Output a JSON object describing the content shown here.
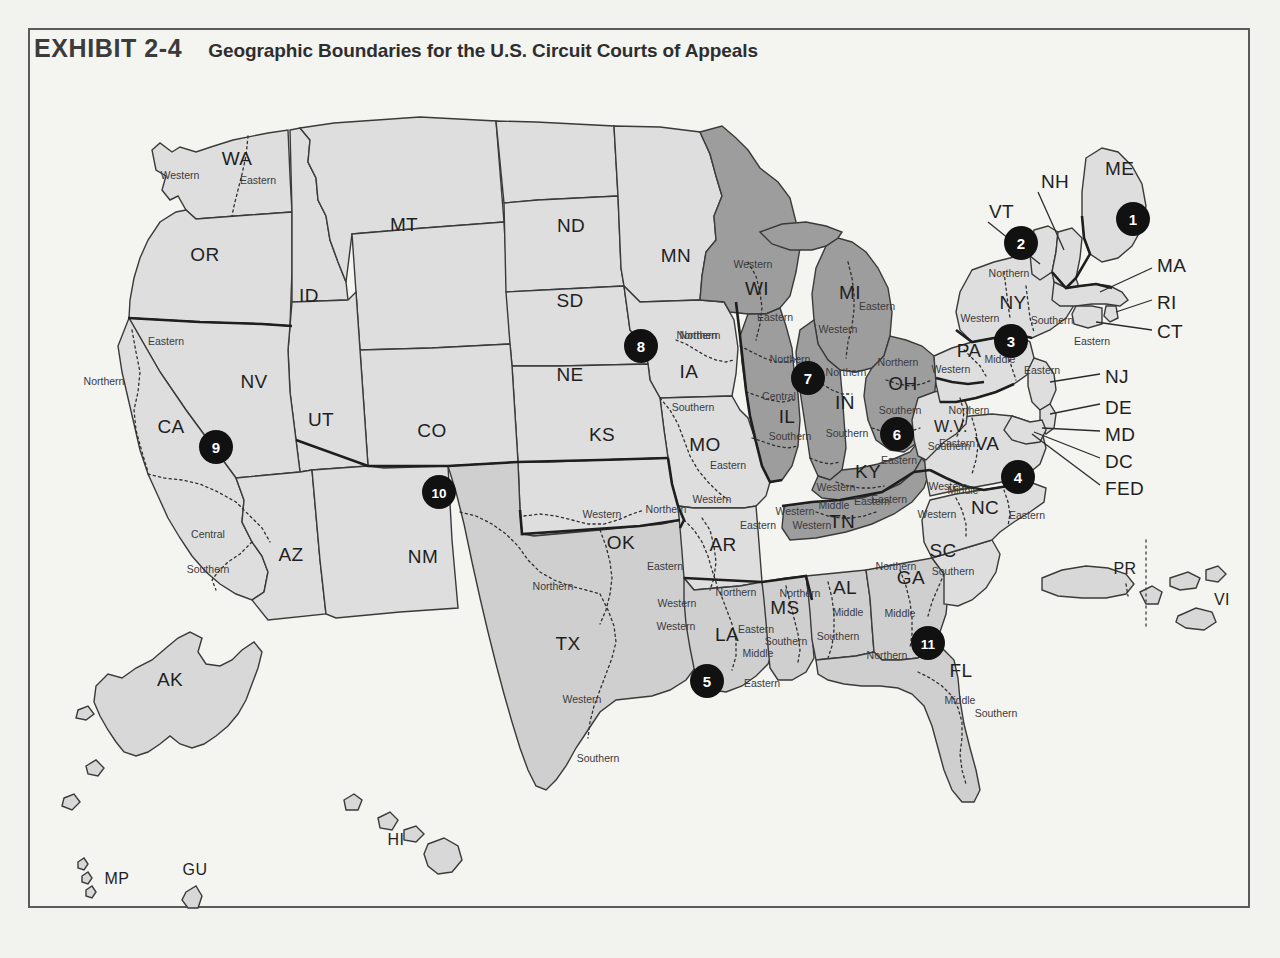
{
  "exhibit": {
    "number": "EXHIBIT 2-4",
    "title": "Geographic Boundaries for the U.S. Circuit Courts of Appeals"
  },
  "map_data": {
    "type": "choropleth-map",
    "subject": "United States Courts of Appeals circuits",
    "fill_light": "#dedede",
    "fill_dark": "#9d9d9d",
    "fill_mid": "#cfcfcf",
    "background": "#f4f4f1",
    "border_color": "#5a5a5a",
    "badge_color": "#111111",
    "badge_text_color": "#ffffff",
    "circuits": [
      {
        "number": "1",
        "x": 1133,
        "y": 219
      },
      {
        "number": "2",
        "x": 1021,
        "y": 243
      },
      {
        "number": "3",
        "x": 1011,
        "y": 341
      },
      {
        "number": "4",
        "x": 1018,
        "y": 477
      },
      {
        "number": "5",
        "x": 707,
        "y": 681
      },
      {
        "number": "6",
        "x": 897,
        "y": 434
      },
      {
        "number": "7",
        "x": 808,
        "y": 378
      },
      {
        "number": "8",
        "x": 641,
        "y": 346
      },
      {
        "number": "9",
        "x": 216,
        "y": 447
      },
      {
        "number": "10",
        "x": 439,
        "y": 492
      },
      {
        "number": "11",
        "x": 928,
        "y": 643
      }
    ],
    "state_labels": [
      {
        "abbr": "WA",
        "x": 237,
        "y": 165
      },
      {
        "abbr": "OR",
        "x": 205,
        "y": 261
      },
      {
        "abbr": "ID",
        "x": 309,
        "y": 302
      },
      {
        "abbr": "MT",
        "x": 404,
        "y": 231
      },
      {
        "abbr": "ND",
        "x": 571,
        "y": 232
      },
      {
        "abbr": "SD",
        "x": 570,
        "y": 307
      },
      {
        "abbr": "MN",
        "x": 676,
        "y": 262
      },
      {
        "abbr": "WI",
        "x": 757,
        "y": 295
      },
      {
        "abbr": "MI",
        "x": 850,
        "y": 299
      },
      {
        "abbr": "NE",
        "x": 570,
        "y": 381
      },
      {
        "abbr": "IA",
        "x": 689,
        "y": 378
      },
      {
        "abbr": "NV",
        "x": 254,
        "y": 388
      },
      {
        "abbr": "CA",
        "x": 171,
        "y": 433
      },
      {
        "abbr": "UT",
        "x": 321,
        "y": 426
      },
      {
        "abbr": "CO",
        "x": 432,
        "y": 437
      },
      {
        "abbr": "KS",
        "x": 602,
        "y": 441
      },
      {
        "abbr": "MO",
        "x": 705,
        "y": 451
      },
      {
        "abbr": "IL",
        "x": 787,
        "y": 423
      },
      {
        "abbr": "IN",
        "x": 845,
        "y": 409
      },
      {
        "abbr": "OH",
        "x": 903,
        "y": 390
      },
      {
        "abbr": "PA",
        "x": 969,
        "y": 357
      },
      {
        "abbr": "NY",
        "x": 1013,
        "y": 309
      },
      {
        "abbr": "AZ",
        "x": 291,
        "y": 561
      },
      {
        "abbr": "NM",
        "x": 423,
        "y": 563
      },
      {
        "abbr": "OK",
        "x": 621,
        "y": 549
      },
      {
        "abbr": "AR",
        "x": 723,
        "y": 551
      },
      {
        "abbr": "KY",
        "x": 868,
        "y": 478
      },
      {
        "abbr": "TN",
        "x": 842,
        "y": 528
      },
      {
        "abbr": "WV",
        "x": 951,
        "y": 432
      },
      {
        "abbr": "VA",
        "x": 987,
        "y": 450
      },
      {
        "abbr": "NC",
        "x": 985,
        "y": 514
      },
      {
        "abbr": "SC",
        "x": 943,
        "y": 557
      },
      {
        "abbr": "MS",
        "x": 785,
        "y": 614
      },
      {
        "abbr": "AL",
        "x": 845,
        "y": 594
      },
      {
        "abbr": "GA",
        "x": 911,
        "y": 584
      },
      {
        "abbr": "LA",
        "x": 727,
        "y": 641
      },
      {
        "abbr": "TX",
        "x": 568,
        "y": 650
      },
      {
        "abbr": "FL",
        "x": 961,
        "y": 677
      },
      {
        "abbr": "AK",
        "x": 170,
        "y": 686
      },
      {
        "abbr": "HI",
        "x": 396,
        "y": 845
      },
      {
        "abbr": "MP",
        "x": 117,
        "y": 884
      },
      {
        "abbr": "GU",
        "x": 195,
        "y": 875
      },
      {
        "abbr": "PR",
        "x": 1125,
        "y": 574
      },
      {
        "abbr": "VI",
        "x": 1222,
        "y": 605
      }
    ],
    "outside_labels": [
      {
        "abbr": "NH",
        "x": 1041,
        "y": 182
      },
      {
        "abbr": "VT",
        "x": 989,
        "y": 212
      },
      {
        "abbr": "ME",
        "x": 1105,
        "y": 169
      },
      {
        "abbr": "MA",
        "x": 1157,
        "y": 266
      },
      {
        "abbr": "RI",
        "x": 1157,
        "y": 303
      },
      {
        "abbr": "CT",
        "x": 1157,
        "y": 332
      },
      {
        "abbr": "NJ",
        "x": 1105,
        "y": 377
      },
      {
        "abbr": "DE",
        "x": 1105,
        "y": 408
      },
      {
        "abbr": "MD",
        "x": 1105,
        "y": 435
      },
      {
        "abbr": "DC",
        "x": 1105,
        "y": 462
      },
      {
        "abbr": "FED",
        "x": 1105,
        "y": 489
      }
    ],
    "district_labels": [
      {
        "text": "Western",
        "x": 180,
        "y": 179
      },
      {
        "text": "Eastern",
        "x": 258,
        "y": 184
      },
      {
        "text": "Eastern",
        "x": 166,
        "y": 345
      },
      {
        "text": "Northern",
        "x": 104,
        "y": 385
      },
      {
        "text": "Central",
        "x": 208,
        "y": 538
      },
      {
        "text": "Southern",
        "x": 208,
        "y": 573
      },
      {
        "text": "Northern",
        "x": 700,
        "y": 339
      },
      {
        "text": "Southern",
        "x": 693,
        "y": 411
      },
      {
        "text": "Eastern",
        "x": 728,
        "y": 469
      },
      {
        "text": "Western",
        "x": 712,
        "y": 503
      },
      {
        "text": "Western",
        "x": 602,
        "y": 518
      },
      {
        "text": "Northern",
        "x": 666,
        "y": 513
      },
      {
        "text": "Eastern",
        "x": 665,
        "y": 570
      },
      {
        "text": "Northern",
        "x": 553,
        "y": 590
      },
      {
        "text": "Western",
        "x": 582,
        "y": 703
      },
      {
        "text": "Southern",
        "x": 598,
        "y": 762
      },
      {
        "text": "Western",
        "x": 677,
        "y": 607
      },
      {
        "text": "Western",
        "x": 676,
        "y": 630
      },
      {
        "text": "Eastern",
        "x": 756,
        "y": 633
      },
      {
        "text": "Eastern",
        "x": 758,
        "y": 529
      },
      {
        "text": "Western",
        "x": 812,
        "y": 529
      },
      {
        "text": "Middle",
        "x": 758,
        "y": 657
      },
      {
        "text": "Eastern",
        "x": 762,
        "y": 687
      },
      {
        "text": "Northern",
        "x": 736,
        "y": 596
      },
      {
        "text": "Southern",
        "x": 786,
        "y": 645
      },
      {
        "text": "Northern",
        "x": 800,
        "y": 597
      },
      {
        "text": "Middle",
        "x": 848,
        "y": 616
      },
      {
        "text": "Southern",
        "x": 838,
        "y": 640
      },
      {
        "text": "Northern",
        "x": 896,
        "y": 570
      },
      {
        "text": "Middle",
        "x": 900,
        "y": 617
      },
      {
        "text": "Southern",
        "x": 953,
        "y": 575
      },
      {
        "text": "Northern",
        "x": 887,
        "y": 659
      },
      {
        "text": "Middle",
        "x": 960,
        "y": 704
      },
      {
        "text": "Southern",
        "x": 996,
        "y": 717
      },
      {
        "text": "Western",
        "x": 753,
        "y": 268
      },
      {
        "text": "Eastern",
        "x": 775,
        "y": 321
      },
      {
        "text": "Western",
        "x": 838,
        "y": 333
      },
      {
        "text": "Eastern",
        "x": 877,
        "y": 310
      },
      {
        "text": "Northern",
        "x": 790,
        "y": 363
      },
      {
        "text": "Central",
        "x": 779,
        "y": 400
      },
      {
        "text": "Southern",
        "x": 790,
        "y": 440
      },
      {
        "text": "Northern",
        "x": 846,
        "y": 376
      },
      {
        "text": "Southern",
        "x": 847,
        "y": 437
      },
      {
        "text": "Northern",
        "x": 898,
        "y": 366
      },
      {
        "text": "Southern",
        "x": 900,
        "y": 414
      },
      {
        "text": "Eastern",
        "x": 899,
        "y": 464
      },
      {
        "text": "Western",
        "x": 836,
        "y": 491
      },
      {
        "text": "Eastern",
        "x": 889,
        "y": 503
      },
      {
        "text": "Middle",
        "x": 834,
        "y": 509
      },
      {
        "text": "Eastern",
        "x": 872,
        "y": 505
      },
      {
        "text": "Western",
        "x": 795,
        "y": 515
      },
      {
        "text": "Northern",
        "x": 969,
        "y": 414
      },
      {
        "text": "Southern",
        "x": 949,
        "y": 450
      },
      {
        "text": "Western",
        "x": 948,
        "y": 490
      },
      {
        "text": "Eastern",
        "x": 957,
        "y": 447
      },
      {
        "text": "Middle",
        "x": 963,
        "y": 494
      },
      {
        "text": "Western",
        "x": 937,
        "y": 518
      },
      {
        "text": "Eastern",
        "x": 1027,
        "y": 519
      },
      {
        "text": "Northern",
        "x": 1009,
        "y": 277
      },
      {
        "text": "Western",
        "x": 980,
        "y": 322
      },
      {
        "text": "Southern",
        "x": 1052,
        "y": 324
      },
      {
        "text": "Eastern",
        "x": 1092,
        "y": 345
      },
      {
        "text": "Western",
        "x": 951,
        "y": 373
      },
      {
        "text": "Middle",
        "x": 1000,
        "y": 363
      },
      {
        "text": "Eastern",
        "x": 1042,
        "y": 374
      },
      {
        "text": "Northern",
        "x": 697,
        "y": 339
      }
    ]
  }
}
